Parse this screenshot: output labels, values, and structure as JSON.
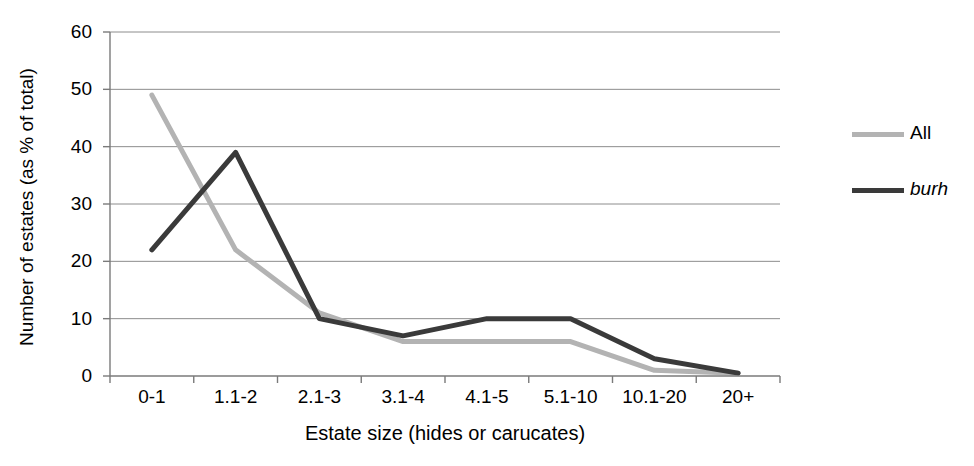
{
  "chart_data": {
    "type": "line",
    "title": "",
    "xlabel": "Estate size (hides or carucates)",
    "ylabel": "Number of estates (as % of total)",
    "categories": [
      "0-1",
      "1.1-2",
      "2.1-3",
      "3.1-4",
      "4.1-5",
      "5.1-10",
      "10.1-20",
      "20+"
    ],
    "series": [
      {
        "name": "All",
        "color": "#b3b3b3",
        "style": "normal",
        "values": [
          49,
          22,
          11,
          6,
          6,
          6,
          1,
          0.5
        ]
      },
      {
        "name": "burh",
        "color": "#3a3a3a",
        "style": "italic",
        "values": [
          22,
          39,
          10,
          7,
          10,
          10,
          3,
          0.5
        ]
      }
    ],
    "ylim": [
      0,
      60
    ],
    "ytick_values": [
      0,
      10,
      20,
      30,
      40,
      50,
      60
    ],
    "ytick_labels": [
      "0",
      "10",
      "20",
      "30",
      "40",
      "50",
      "60"
    ],
    "grid": "horizontal",
    "legend_position": "right"
  },
  "axes": {
    "y_title": "Number of estates (as % of total)",
    "x_title": "Estate size (hides or carucates)"
  },
  "legend": {
    "entries": [
      {
        "label": "All",
        "color": "#b3b3b3"
      },
      {
        "label": "burh",
        "color": "#3a3a3a"
      }
    ]
  },
  "style": {
    "gridline_color": "#8c8c8c",
    "axis_color": "#7a7a7a",
    "background": "#ffffff",
    "text_color": "#000000"
  }
}
